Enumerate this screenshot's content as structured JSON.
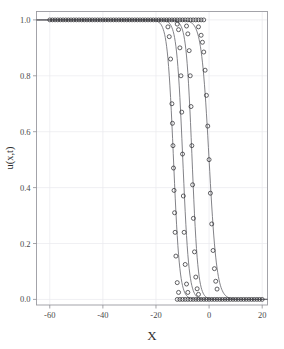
{
  "chart_data": {
    "type": "line",
    "title": "",
    "subtitle": "",
    "xlabel": "X",
    "ylabel": "u(x,t)",
    "xlim": [
      -65,
      22
    ],
    "ylim": [
      -0.02,
      1.03
    ],
    "xticks": [
      -60,
      -40,
      -20,
      0,
      20
    ],
    "xticklabels": [
      "-60",
      "-40",
      "-20",
      "0",
      "20"
    ],
    "yticks": [
      0.0,
      0.2,
      0.4,
      0.6,
      0.8,
      1.0
    ],
    "yticklabels": [
      "0.0",
      "0.2",
      "0.4",
      "0.6",
      "0.8",
      "1.0"
    ],
    "grid": true,
    "legend": "none",
    "marker": "circle-open",
    "annotations": [],
    "series": [
      {
        "name": "t1",
        "front_center": -13.4,
        "front_width": 1.15,
        "marker_spacing": 1.0,
        "x": [
          -62,
          -60,
          -58,
          -56,
          -54,
          -52,
          -50,
          -48,
          -46,
          -44,
          -42,
          -40,
          -38,
          -36,
          -34,
          -32,
          -30,
          -28,
          -26,
          -24,
          -22,
          -20,
          -18,
          -17,
          -16,
          -15.5,
          -15,
          -14.5,
          -14,
          -13.8,
          -13.6,
          -13.4,
          -13.2,
          -13,
          -12.8,
          -12.5,
          -12,
          -11.5,
          -11,
          -10.5,
          -10,
          -9,
          -8,
          -6,
          -4,
          -2,
          0,
          2,
          4,
          6,
          8,
          10,
          12,
          14,
          16,
          18,
          20
        ],
        "y": [
          1.0,
          1.0,
          1.0,
          1.0,
          1.0,
          1.0,
          1.0,
          1.0,
          1.0,
          1.0,
          1.0,
          1.0,
          1.0,
          1.0,
          1.0,
          1.0,
          1.0,
          1.0,
          1.0,
          1.0,
          1.0,
          1.0,
          0.999,
          0.997,
          0.99,
          0.975,
          0.94,
          0.86,
          0.7,
          0.63,
          0.55,
          0.47,
          0.39,
          0.31,
          0.24,
          0.155,
          0.06,
          0.025,
          0.011,
          0.005,
          0.003,
          0.001,
          0.0,
          0.0,
          0.0,
          0.0,
          0.0,
          0.0,
          0.0,
          0.0,
          0.0,
          0.0,
          0.0,
          0.0,
          0.0,
          0.0,
          0.0
        ]
      },
      {
        "name": "t2",
        "front_center": -9.9,
        "front_width": 1.15,
        "marker_spacing": 1.0,
        "x": [
          -62,
          -60,
          -58,
          -56,
          -54,
          -52,
          -50,
          -48,
          -46,
          -44,
          -42,
          -40,
          -38,
          -36,
          -34,
          -32,
          -30,
          -28,
          -26,
          -24,
          -22,
          -20,
          -18,
          -16,
          -14,
          -13,
          -12,
          -11.5,
          -11,
          -10.6,
          -10.3,
          -10,
          -9.7,
          -9.4,
          -9,
          -8.5,
          -8,
          -7.5,
          -7,
          -6,
          -5,
          -4,
          -2,
          0,
          2,
          4,
          6,
          8,
          10,
          12,
          14,
          16,
          18,
          20
        ],
        "y": [
          1.0,
          1.0,
          1.0,
          1.0,
          1.0,
          1.0,
          1.0,
          1.0,
          1.0,
          1.0,
          1.0,
          1.0,
          1.0,
          1.0,
          1.0,
          1.0,
          1.0,
          1.0,
          1.0,
          1.0,
          1.0,
          1.0,
          1.0,
          1.0,
          0.999,
          0.997,
          0.985,
          0.965,
          0.9,
          0.8,
          0.67,
          0.52,
          0.37,
          0.24,
          0.125,
          0.055,
          0.025,
          0.012,
          0.006,
          0.002,
          0.001,
          0.0,
          0.0,
          0.0,
          0.0,
          0.0,
          0.0,
          0.0,
          0.0,
          0.0,
          0.0,
          0.0,
          0.0,
          0.0
        ]
      },
      {
        "name": "t3",
        "front_center": -6.4,
        "front_width": 1.1,
        "marker_spacing": 1.0,
        "x": [
          -62,
          -60,
          -58,
          -56,
          -54,
          -52,
          -50,
          -48,
          -46,
          -44,
          -42,
          -40,
          -38,
          -36,
          -34,
          -32,
          -30,
          -28,
          -26,
          -24,
          -22,
          -20,
          -18,
          -16,
          -14,
          -12,
          -10,
          -9,
          -8.5,
          -8,
          -7.5,
          -7.1,
          -6.8,
          -6.5,
          -6.2,
          -5.9,
          -5.5,
          -5,
          -4.5,
          -4,
          -3.5,
          -3,
          -2,
          -1,
          0,
          2,
          4,
          6,
          8,
          10,
          12,
          14,
          16,
          18,
          20
        ],
        "y": [
          1.0,
          1.0,
          1.0,
          1.0,
          1.0,
          1.0,
          1.0,
          1.0,
          1.0,
          1.0,
          1.0,
          1.0,
          1.0,
          1.0,
          1.0,
          1.0,
          1.0,
          1.0,
          1.0,
          1.0,
          1.0,
          1.0,
          1.0,
          1.0,
          1.0,
          0.999,
          0.996,
          0.99,
          0.978,
          0.95,
          0.89,
          0.8,
          0.69,
          0.55,
          0.41,
          0.29,
          0.17,
          0.08,
          0.038,
          0.018,
          0.009,
          0.004,
          0.001,
          0.0,
          0.0,
          0.0,
          0.0,
          0.0,
          0.0,
          0.0,
          0.0,
          0.0,
          0.0,
          0.0,
          0.0
        ]
      },
      {
        "name": "t4",
        "front_center": 0.0,
        "front_width": 1.45,
        "marker_spacing": 1.0,
        "x": [
          -62,
          -60,
          -58,
          -56,
          -54,
          -52,
          -50,
          -48,
          -46,
          -44,
          -42,
          -40,
          -38,
          -36,
          -34,
          -32,
          -30,
          -28,
          -26,
          -24,
          -22,
          -20,
          -18,
          -16,
          -14,
          -12,
          -10,
          -8,
          -6,
          -5,
          -4,
          -3,
          -2.5,
          -2,
          -1.5,
          -1,
          -0.5,
          0,
          0.5,
          1,
          1.5,
          2,
          2.5,
          3,
          4,
          5,
          6,
          8,
          10,
          12,
          14,
          16,
          18,
          20
        ],
        "y": [
          1.0,
          1.0,
          1.0,
          1.0,
          1.0,
          1.0,
          1.0,
          1.0,
          1.0,
          1.0,
          1.0,
          1.0,
          1.0,
          1.0,
          1.0,
          1.0,
          1.0,
          1.0,
          1.0,
          1.0,
          1.0,
          1.0,
          1.0,
          1.0,
          1.0,
          1.0,
          1.0,
          0.999,
          0.995,
          0.99,
          0.975,
          0.945,
          0.92,
          0.885,
          0.82,
          0.73,
          0.62,
          0.5,
          0.38,
          0.27,
          0.175,
          0.11,
          0.065,
          0.037,
          0.012,
          0.005,
          0.002,
          0.0,
          0.0,
          0.0,
          0.0,
          0.0,
          0.0,
          0.0
        ]
      }
    ],
    "plateau_top_markers": {
      "value": 1.0,
      "x_start": -60,
      "x_end": -2,
      "spacing": 1.0
    },
    "plateau_bottom_markers": {
      "value": 0.0,
      "x_start": -12,
      "x_end": 20,
      "spacing": 1.0
    },
    "colors": {
      "curve": "#6d6d73",
      "marker": "#2f2f33",
      "grid": "#e9e9ee",
      "frame": "#9a9aa0",
      "background": "#ffffff",
      "text": "#3a3a3a"
    }
  }
}
